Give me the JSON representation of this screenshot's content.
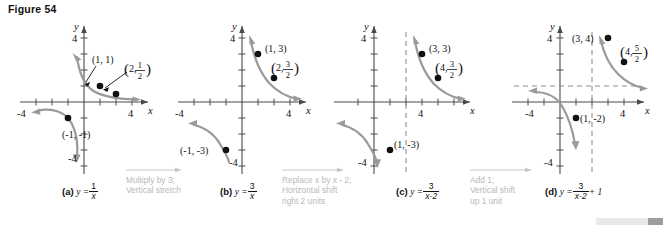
{
  "figure": {
    "title": "Figure 54",
    "axis_labels": {
      "x": "x",
      "y": "y"
    },
    "tick_labels": {
      "pos4": "4",
      "neg4": "-4"
    }
  },
  "panels": [
    {
      "id": "panel-a",
      "label": "(a)",
      "equation_plain": "y = 1/x",
      "equation_lhs": "y =",
      "numerator": "1",
      "denominator": "x",
      "addend": "",
      "points": [
        {
          "name": "point-1-1",
          "label": "(1, 1)",
          "x": 1,
          "y": 1
        },
        {
          "name": "point-2-half",
          "label": "(2, 1/2)",
          "x": 2,
          "y": 0.5,
          "fraction": {
            "num": "1",
            "den": "2"
          },
          "prefix": "2,"
        },
        {
          "name": "point-neg1-neg1",
          "label": "(-1, -1)",
          "x": -1,
          "y": -1
        }
      ],
      "asymptotes": {
        "vertical": null,
        "horizontal": null
      }
    },
    {
      "id": "panel-b",
      "label": "(b)",
      "equation_plain": "y = 3/x",
      "equation_lhs": "y =",
      "numerator": "3",
      "denominator": "x",
      "addend": "",
      "points": [
        {
          "name": "point-1-3",
          "label": "(1, 3)",
          "x": 1,
          "y": 3
        },
        {
          "name": "point-2-three-halves",
          "label": "(2, 3/2)",
          "x": 2,
          "y": 1.5,
          "fraction": {
            "num": "3",
            "den": "2"
          },
          "prefix": "2,"
        },
        {
          "name": "point-neg1-neg3",
          "label": "(-1, -3)",
          "x": -1,
          "y": -3
        }
      ],
      "asymptotes": {
        "vertical": null,
        "horizontal": null
      }
    },
    {
      "id": "panel-c",
      "label": "(c)",
      "equation_plain": "y = 3/(x-2)",
      "equation_lhs": "y =",
      "numerator": "3",
      "denominator": "x-2",
      "addend": "",
      "points": [
        {
          "name": "point-3-3",
          "label": "(3, 3)",
          "x": 3,
          "y": 3
        },
        {
          "name": "point-4-three-halves",
          "label": "(4, 3/2)",
          "x": 4,
          "y": 1.5,
          "fraction": {
            "num": "3",
            "den": "2"
          },
          "prefix": "4,"
        },
        {
          "name": "point-1-neg3",
          "label": "(1, -3)",
          "x": 1,
          "y": -3
        }
      ],
      "asymptotes": {
        "vertical": 2,
        "horizontal": null
      }
    },
    {
      "id": "panel-d",
      "label": "(d)",
      "equation_plain": "y = 3/(x-2) + 1",
      "equation_lhs": "y =",
      "numerator": "3",
      "denominator": "x-2",
      "addend": "+ 1",
      "points": [
        {
          "name": "point-3-4",
          "label": "(3, 4)",
          "x": 3,
          "y": 4
        },
        {
          "name": "point-4-five-halves",
          "label": "(4, 5/2)",
          "x": 4,
          "y": 2.5,
          "fraction": {
            "num": "5",
            "den": "2"
          },
          "prefix": "4,"
        },
        {
          "name": "point-1-neg2",
          "label": "(1, -2)",
          "x": 1,
          "y": -2
        }
      ],
      "asymptotes": {
        "vertical": 2,
        "horizontal": 1
      }
    }
  ],
  "transitions": [
    {
      "id": "transition-a-b",
      "lines": [
        "Multiply by 3;",
        "Vertical stretch"
      ]
    },
    {
      "id": "transition-b-c",
      "lines": [
        "Replace x by x - 2;",
        "Horizontal shift",
        "right 2 units"
      ]
    },
    {
      "id": "transition-c-d",
      "lines": [
        "Add 1;",
        "Vertical shift",
        "up 1 unit"
      ]
    }
  ],
  "colors": {
    "curve": "#9a9a9a",
    "axis": "#4a4a4a",
    "point": "#111111",
    "transition_text": "#bcbcbc",
    "scrollbar_track": "#e9e9e9",
    "scrollbar_thumb": "#9d9d9d"
  },
  "scrollbar": {
    "name": "horizontal-scrollbar"
  }
}
